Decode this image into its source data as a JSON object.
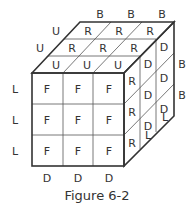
{
  "figure": {
    "caption": "Figure 6-2",
    "front_face": [
      [
        "F",
        "F",
        "F"
      ],
      [
        "F",
        "F",
        "F"
      ],
      [
        "F",
        "F",
        "F"
      ]
    ],
    "top_face": [
      [
        "R",
        "R",
        "R"
      ],
      [
        "R",
        "R",
        "R"
      ],
      [
        "U",
        "U",
        "U"
      ]
    ],
    "right_face": [
      [
        "R",
        "D",
        "D"
      ],
      [
        "R",
        "D",
        "D"
      ],
      [
        "R",
        "D",
        "D"
      ]
    ],
    "outer_labels": {
      "top_back": [
        "B",
        "B",
        "B"
      ],
      "top_left": [
        "U",
        "U"
      ],
      "left": [
        "L",
        "L",
        "L"
      ],
      "bottom": [
        "D",
        "D",
        "D"
      ],
      "right": [
        "B",
        "B"
      ],
      "bottom_right": [
        "L",
        "L"
      ]
    }
  }
}
